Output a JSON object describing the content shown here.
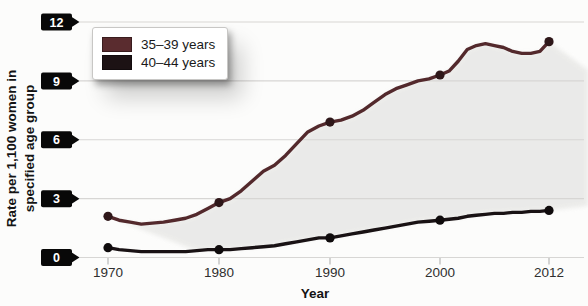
{
  "figure": {
    "y_axis_title": [
      "Rate per 1,100 women in",
      "specified age group"
    ],
    "x_axis_title": "Year"
  },
  "legend": {
    "items": [
      {
        "label": "35–39 years",
        "color": "#5a2c2f"
      },
      {
        "label": "40–44 years",
        "color": "#1c1214"
      }
    ]
  },
  "chart_data": {
    "type": "line",
    "title": "",
    "xlabel": "Year",
    "ylabel": "Rate per 1,100 women in specified age group",
    "ylim": [
      0,
      12
    ],
    "yticks": [
      0,
      3,
      6,
      9,
      12
    ],
    "xticks": [
      1970,
      1980,
      1990,
      2000,
      2012
    ],
    "marker_years": [
      1970,
      1980,
      1990,
      2000,
      2012
    ],
    "grid": true,
    "legend_position": "top-left",
    "area_fill_color": "#e8e8e6",
    "x": [
      1970,
      1971,
      1972,
      1973,
      1974,
      1975,
      1976,
      1977,
      1978,
      1979,
      1980,
      1981,
      1982,
      1983,
      1984,
      1985,
      1986,
      1987,
      1988,
      1989,
      1990,
      1991,
      1992,
      1993,
      1994,
      1995,
      1996,
      1997,
      1998,
      1999,
      2000,
      2001,
      2002,
      2003,
      2004,
      2005,
      2006,
      2007,
      2008,
      2009,
      2010,
      2011,
      2012
    ],
    "series": [
      {
        "name": "35–39 years",
        "color": "#53292c",
        "marker_color": "#2e1719",
        "values": [
          2.1,
          1.9,
          1.8,
          1.7,
          1.75,
          1.8,
          1.9,
          2.0,
          2.2,
          2.5,
          2.8,
          3.0,
          3.4,
          3.9,
          4.4,
          4.7,
          5.2,
          5.8,
          6.4,
          6.7,
          6.9,
          7.0,
          7.2,
          7.5,
          7.9,
          8.3,
          8.6,
          8.8,
          9.0,
          9.1,
          9.3,
          9.5,
          10.0,
          10.6,
          10.8,
          10.9,
          10.8,
          10.7,
          10.5,
          10.4,
          10.4,
          10.5,
          11.0
        ]
      },
      {
        "name": "40–44 years",
        "color": "#191214",
        "marker_color": "#0f0b0c",
        "values": [
          0.5,
          0.4,
          0.35,
          0.3,
          0.3,
          0.3,
          0.3,
          0.3,
          0.35,
          0.4,
          0.4,
          0.4,
          0.45,
          0.5,
          0.55,
          0.6,
          0.7,
          0.8,
          0.9,
          1.0,
          1.0,
          1.1,
          1.2,
          1.3,
          1.4,
          1.5,
          1.6,
          1.7,
          1.8,
          1.85,
          1.9,
          1.95,
          2.0,
          2.1,
          2.15,
          2.2,
          2.25,
          2.25,
          2.3,
          2.3,
          2.35,
          2.35,
          2.4
        ]
      }
    ]
  }
}
